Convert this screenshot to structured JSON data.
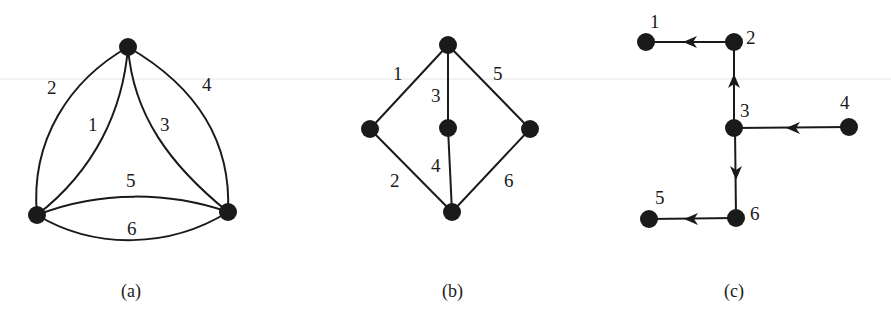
{
  "figures": [
    {
      "id": "a",
      "caption": "(a)",
      "description": "Multigraph with 3 vertices and 6 curved edges",
      "nodes": [
        {
          "id": "top",
          "x": 128,
          "y": 47
        },
        {
          "id": "bottom-left",
          "x": 37,
          "y": 215
        },
        {
          "id": "bottom-right",
          "x": 228,
          "y": 212
        }
      ],
      "edges": [
        {
          "label": "1",
          "from": "bottom-left",
          "to": "top"
        },
        {
          "label": "2",
          "from": "bottom-left",
          "to": "top"
        },
        {
          "label": "3",
          "from": "top",
          "to": "bottom-right"
        },
        {
          "label": "4",
          "from": "top",
          "to": "bottom-right"
        },
        {
          "label": "5",
          "from": "bottom-left",
          "to": "bottom-right"
        },
        {
          "label": "6",
          "from": "bottom-left",
          "to": "bottom-right"
        }
      ]
    },
    {
      "id": "b",
      "caption": "(b)",
      "description": "Graph with 5 vertices and 6 straight edges",
      "nodes": [
        {
          "id": "top",
          "x": 448,
          "y": 45
        },
        {
          "id": "left",
          "x": 370,
          "y": 129
        },
        {
          "id": "center",
          "x": 448,
          "y": 128
        },
        {
          "id": "right",
          "x": 530,
          "y": 129
        },
        {
          "id": "bottom",
          "x": 452,
          "y": 212
        }
      ],
      "edges": [
        {
          "label": "1",
          "from": "top",
          "to": "left"
        },
        {
          "label": "2",
          "from": "left",
          "to": "bottom"
        },
        {
          "label": "3",
          "from": "top",
          "to": "center"
        },
        {
          "label": "4",
          "from": "center",
          "to": "bottom"
        },
        {
          "label": "5",
          "from": "top",
          "to": "right"
        },
        {
          "label": "6",
          "from": "right",
          "to": "bottom"
        }
      ]
    },
    {
      "id": "c",
      "caption": "(c)",
      "description": "Directed tree with 6 labeled vertices rooted at 4",
      "nodes": [
        {
          "id": "1",
          "label": "1",
          "x": 646,
          "y": 42
        },
        {
          "id": "2",
          "label": "2",
          "x": 734,
          "y": 42
        },
        {
          "id": "3",
          "label": "3",
          "x": 734,
          "y": 128
        },
        {
          "id": "4",
          "label": "4",
          "x": 849,
          "y": 127
        },
        {
          "id": "5",
          "label": "5",
          "x": 649,
          "y": 219
        },
        {
          "id": "6",
          "label": "6",
          "x": 736,
          "y": 218
        }
      ],
      "edges": [
        {
          "from": "2",
          "to": "1",
          "directed": true
        },
        {
          "from": "3",
          "to": "2",
          "directed": true
        },
        {
          "from": "4",
          "to": "3",
          "directed": true
        },
        {
          "from": "3",
          "to": "6",
          "directed": true
        },
        {
          "from": "6",
          "to": "5",
          "directed": true
        }
      ]
    }
  ],
  "colors": {
    "ink": "#1a1a1a",
    "background": "#ffffff"
  }
}
